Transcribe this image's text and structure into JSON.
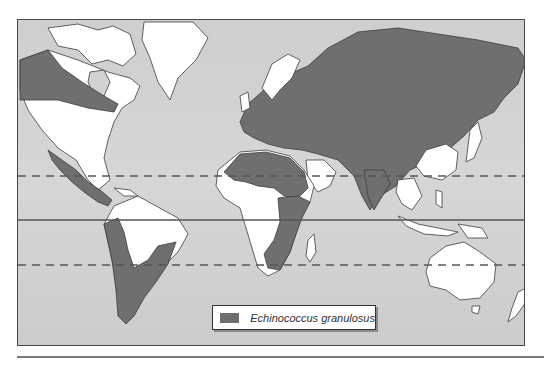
{
  "figure": {
    "colors": {
      "ocean": "#d2d2d2",
      "land_free": "#ffffff",
      "endemic": "#6f6f6f",
      "border": "#3c3c3c",
      "latitude_lines": "#555555"
    }
  },
  "map": {
    "reference_lines": [
      {
        "name": "Tropic of Cancer",
        "style": "dashed",
        "y": 156
      },
      {
        "name": "Equator",
        "style": "solid",
        "y": 200
      },
      {
        "name": "Tropic of Capricorn",
        "style": "dashed",
        "y": 245
      }
    ],
    "endemic_regions": [
      "Western Canada and Alaska",
      "Mexico",
      "Central America",
      "Western South America",
      "Southern South America",
      "Europe",
      "Russia",
      "Central Asia",
      "Middle East",
      "North Africa",
      "East Africa",
      "Southern Africa",
      "India",
      "Mongolia",
      "Kamchatka"
    ],
    "non_endemic_regions": [
      "Greenland",
      "Eastern Canada",
      "United States",
      "Northern South America",
      "Brazil",
      "West Africa",
      "Central Africa",
      "South Africa",
      "Arabian Peninsula",
      "Scandinavia",
      "China",
      "Southeast Asia",
      "Australia",
      "New Zealand",
      "Madagascar",
      "Japan"
    ]
  },
  "legend": {
    "items": [
      {
        "label": "Echinococcus granulosus",
        "color": "#6f6f6f"
      }
    ]
  }
}
